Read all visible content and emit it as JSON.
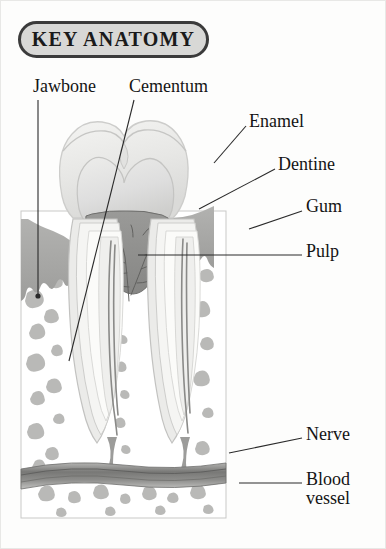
{
  "header": {
    "title": "KEY ANATOMY"
  },
  "diagram": {
    "colors": {
      "pill_border": "#3b3b3b",
      "pill_fill": "#d8d8d6",
      "enamel": "#ebebe9",
      "dentine": "#dcdcda",
      "pulp": "#8e8e8c",
      "gum": "#a9a9a7",
      "bone": "#ffffff",
      "trabecula": "#b8b8b6",
      "vessel": "#7d7d7b",
      "leader_line": "#2a2a2a",
      "text": "#141414"
    }
  },
  "labels": [
    {
      "id": "jawbone",
      "text": "Jawbone"
    },
    {
      "id": "cementum",
      "text": "Cementum"
    },
    {
      "id": "enamel",
      "text": "Enamel"
    },
    {
      "id": "dentine",
      "text": "Dentine"
    },
    {
      "id": "gum",
      "text": "Gum"
    },
    {
      "id": "pulp",
      "text": "Pulp"
    },
    {
      "id": "nerve",
      "text": "Nerve"
    },
    {
      "id": "blood_vessel",
      "text": "Blood vessel"
    }
  ]
}
